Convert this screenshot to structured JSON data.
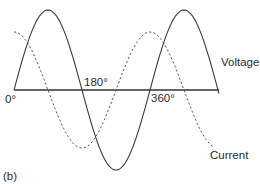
{
  "figure": {
    "panel_label": "(b)",
    "axis": {
      "x_start": 14,
      "x_end": 219,
      "y": 90
    },
    "ticks": [
      {
        "label": "0°",
        "x": 5,
        "y": 103
      },
      {
        "label": "180°",
        "x": 84,
        "y": 86
      },
      {
        "label": "360°",
        "x": 151,
        "y": 102
      }
    ],
    "voltage": {
      "label": "Voltage",
      "style": "solid",
      "x0": 14,
      "period": 136,
      "amplitude": 80,
      "phase_deg": 0,
      "x_from": 14,
      "x_to": 219,
      "label_x": 221,
      "label_y": 66
    },
    "current": {
      "label": "Current",
      "style": "dashed",
      "x0": 14,
      "period": 136,
      "amplitude": 58,
      "phase_deg": -90,
      "x_from": 14,
      "x_to": 214,
      "label_x": 210,
      "label_y": 159
    },
    "colors": {
      "line": "#3a3a3a",
      "axis": "#333333",
      "text": "#2a2a2a"
    }
  }
}
